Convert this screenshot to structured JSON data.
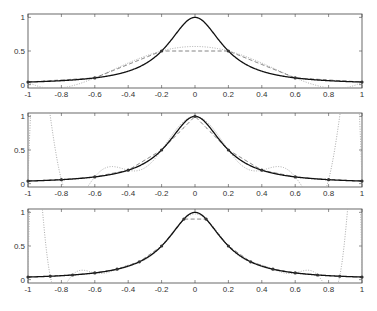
{
  "chart_data": [
    {
      "type": "line",
      "title": "",
      "xlabel": "",
      "ylabel": "",
      "xlim": [
        -1,
        1
      ],
      "ylim": [
        -0.05,
        1.05
      ],
      "xticks": [
        "-1",
        "-0.8",
        "-0.6",
        "-0.4",
        "-0.2",
        "0",
        "0.2",
        "0.4",
        "0.6",
        "0.8",
        "1"
      ],
      "yticks": [
        "0",
        "0.5",
        "1"
      ],
      "nodes_count": 6,
      "nodes_x": [
        -1,
        -0.6,
        -0.2,
        0.2,
        0.6,
        1
      ],
      "series": [
        {
          "name": "f(x)=1/(1+25x^2)",
          "style": "solid"
        },
        {
          "name": "piecewise linear interpolant",
          "style": "dashed"
        },
        {
          "name": "polynomial interpolant",
          "style": "dotted"
        }
      ],
      "frame": {
        "top": 14,
        "bottom": 88
      }
    },
    {
      "type": "line",
      "title": "",
      "xlabel": "",
      "ylabel": "",
      "xlim": [
        -1,
        1
      ],
      "ylim": [
        -0.05,
        1.05
      ],
      "xticks": [
        "-1",
        "-0.8",
        "-0.6",
        "-0.4",
        "-0.2",
        "0",
        "0.2",
        "0.4",
        "0.6",
        "0.8",
        "1"
      ],
      "yticks": [
        "0",
        "0.5",
        "1"
      ],
      "nodes_count": 11,
      "nodes_x": [
        -1,
        -0.8,
        -0.6,
        -0.4,
        -0.2,
        0,
        0.2,
        0.4,
        0.6,
        0.8,
        1
      ],
      "series": [
        {
          "name": "f(x)=1/(1+25x^2)",
          "style": "solid"
        },
        {
          "name": "piecewise linear interpolant",
          "style": "dashed"
        },
        {
          "name": "polynomial interpolant",
          "style": "dotted"
        }
      ],
      "frame": {
        "top": 113,
        "bottom": 187
      }
    },
    {
      "type": "line",
      "title": "",
      "xlabel": "",
      "ylabel": "",
      "xlim": [
        -1,
        1
      ],
      "ylim": [
        -0.05,
        1.05
      ],
      "xticks": [
        "-1",
        "-0.8",
        "-0.6",
        "-0.4",
        "-0.2",
        "0",
        "0.2",
        "0.4",
        "0.6",
        "0.8",
        "1"
      ],
      "yticks": [
        "0",
        "0.5",
        "1"
      ],
      "nodes_count": 16,
      "nodes_x": [
        -1,
        -0.867,
        -0.733,
        -0.6,
        -0.467,
        -0.333,
        -0.2,
        -0.067,
        0.067,
        0.2,
        0.333,
        0.467,
        0.6,
        0.733,
        0.867,
        1
      ],
      "series": [
        {
          "name": "f(x)=1/(1+25x^2)",
          "style": "solid"
        },
        {
          "name": "piecewise linear interpolant",
          "style": "dashed"
        },
        {
          "name": "polynomial interpolant",
          "style": "dotted"
        }
      ],
      "frame": {
        "top": 209,
        "bottom": 283
      }
    }
  ],
  "layout": {
    "left": 28,
    "right": 362,
    "tick_label_offset": 9
  },
  "colors": {
    "function": "#111111",
    "linear": "#555555",
    "poly": "#aaaaaa",
    "axis": "#444444",
    "marker": "#333333"
  }
}
